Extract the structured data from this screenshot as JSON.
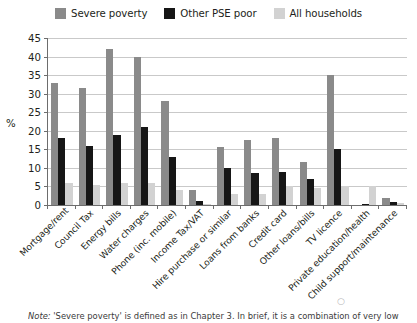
{
  "legend": {
    "items": [
      {
        "label": "Severe poverty",
        "color": "#8a8a8a",
        "icon": "legend-swatch-severe-poverty"
      },
      {
        "label": "Other PSE poor",
        "color": "#161616",
        "icon": "legend-swatch-other-pse-poor"
      },
      {
        "label": "All households",
        "color": "#d2d2d2",
        "icon": "legend-swatch-all-households"
      }
    ]
  },
  "axis": {
    "y_label": "%",
    "y_ticks": [
      "45",
      "40",
      "35",
      "30",
      "25",
      "20",
      "15",
      "10",
      "5",
      "0"
    ]
  },
  "note": {
    "prefix": "Note:",
    "text": " 'Severe poverty' is defined as in Chapter 3. In brief, it is a combination of very low"
  },
  "chart_data": {
    "type": "bar",
    "title": "",
    "xlabel": "",
    "ylabel": "%",
    "ylim": [
      0,
      45
    ],
    "ytick_step": 5,
    "grid": true,
    "legend_position": "top",
    "orientation": "vertical",
    "grouped": true,
    "categories": [
      "Mortgage/rent",
      "Council Tax",
      "Energy bills",
      "Water charges",
      "Phone (inc. mobile)",
      "Income Tax/VAT",
      "Hire purchase or similar",
      "Loans from banks",
      "Credit card",
      "Other loans/bills",
      "TV licence",
      "Private education/health",
      "Child support/maintenance"
    ],
    "series": [
      {
        "name": "Severe poverty",
        "color": "#8a8a8a",
        "values": [
          33,
          31.5,
          42,
          40,
          28,
          4,
          15.5,
          17.5,
          18,
          11.5,
          35,
          0,
          2
        ]
      },
      {
        "name": "Other PSE poor",
        "color": "#161616",
        "values": [
          18,
          16,
          19,
          21,
          13,
          1,
          10,
          8.5,
          9,
          7,
          15,
          0.3,
          0.7
        ]
      },
      {
        "name": "All households",
        "color": "#d2d2d2",
        "values": [
          6,
          5.5,
          6,
          6,
          4,
          0.4,
          3,
          3,
          5,
          4.5,
          5,
          5,
          0.5
        ]
      }
    ]
  }
}
